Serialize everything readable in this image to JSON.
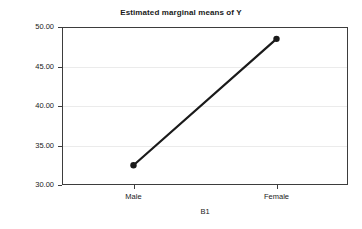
{
  "chart_data": {
    "type": "line",
    "title": "Estimated marginal means of Y",
    "xlabel": "B1",
    "ylabel": "Estimated marginal means",
    "categories": [
      "Male",
      "Female"
    ],
    "values": [
      32.5,
      48.5
    ],
    "series": [
      {
        "name": "Estimated marginal means of Y",
        "values": [
          32.5,
          48.5
        ]
      }
    ],
    "ylim": [
      30.0,
      50.0
    ],
    "y_ticks": [
      "30.00",
      "35.00",
      "40.00",
      "45.00",
      "50.00"
    ],
    "y_tick_values": [
      30.0,
      35.0,
      40.0,
      45.0,
      50.0
    ],
    "x_ticks": [
      "Male",
      "Female"
    ],
    "grid": true,
    "legend": "none",
    "line_color": "#1a1a1a",
    "marker": "circle",
    "marker_color": "#1a1a1a",
    "background_color": "#ffffff",
    "axis_color": "#3d3d3d",
    "gridline_color": "#ebebeb"
  }
}
